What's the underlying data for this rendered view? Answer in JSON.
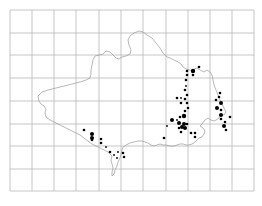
{
  "map": {
    "width": 262,
    "height": 206,
    "grid": {
      "color": "#b8b8b8",
      "x_lines": [
        10,
        32,
        54,
        76,
        99,
        121,
        143,
        166,
        188,
        210,
        232,
        254
      ],
      "y_lines": [
        10,
        33,
        55,
        78,
        101,
        124,
        146,
        169,
        191
      ],
      "left": 10,
      "right": 254,
      "top": 10,
      "bottom": 191
    },
    "outline": {
      "color": "#9a9a9a",
      "paths": [
        "M38,96 L42,92 L48,90 L56,88 L64,86 L72,84 L80,82 L86,80 L90,78 L91,74 L91,70 L92,65 L93,60 L95,56 L99,55 L103,54 L106,51 L110,52 L113,55 L116,58 L119,59 L122,57 L126,56 L130,54 L131,50 L129,45 L128,40 L130,36 L134,33 L139,31 L143,32 L147,35 L152,38 L156,43 L160,48 L163,53 L167,57 L170,58 L174,60 L178,62 L181,64 L183,67 L186,69 L190,70 L193,72 L194,69 L197,68 L200,70 L204,72 L207,70 L210,72 L212,75 L213,80 L214,85 L216,90 L218,95 L220,100 L222,104 L224,108 L226,112 L224,115 L221,115 L219,118 L216,120 L214,121 L211,120 L208,118 L205,120 L202,124 L200,126 L203,128 L205,131 L204,134 L202,137 L199,138 L197,140 L195,142 L192,144 L189,145 L186,145 L183,144 L180,144 L177,145 L174,146 L170,146 L166,145 L163,145 L160,144 L157,145 L154,146 L151,145 L148,143 L145,142 L142,141 L138,141 L134,142 L130,143 L126,145 L123,147",
        "M123,147 L122,150 L121,154 L120,158 L118,162 L117,166 L115,170 L114,174 L112,176 L112,172 L113,168 L112,164 L111,160 L112,156 L110,154 L108,152 L104,150 L100,148 L96,146 L92,144 L88,141 L84,138 L80,135 L74,132 L68,129 L62,126 L56,123 L50,120 L46,117 L45,113 L46,109 L44,106 L41,104 L39,101 L38,96"
      ]
    },
    "dots": [
      {
        "x": 199,
        "y": 67,
        "r": 1.3
      },
      {
        "x": 193,
        "y": 71,
        "r": 2.2
      },
      {
        "x": 187,
        "y": 71,
        "r": 1.3
      },
      {
        "x": 187,
        "y": 75,
        "r": 1.3
      },
      {
        "x": 193,
        "y": 75,
        "r": 1.3
      },
      {
        "x": 186,
        "y": 80,
        "r": 1.3
      },
      {
        "x": 186,
        "y": 86,
        "r": 0.9
      },
      {
        "x": 185,
        "y": 90,
        "r": 1.3
      },
      {
        "x": 187,
        "y": 95,
        "r": 1.3
      },
      {
        "x": 177,
        "y": 98,
        "r": 1.3
      },
      {
        "x": 181,
        "y": 98,
        "r": 0.9
      },
      {
        "x": 185,
        "y": 99,
        "r": 1.3
      },
      {
        "x": 181,
        "y": 103,
        "r": 1.3
      },
      {
        "x": 187,
        "y": 103,
        "r": 1.3
      },
      {
        "x": 188,
        "y": 108,
        "r": 1.3
      },
      {
        "x": 172,
        "y": 120,
        "r": 2.0
      },
      {
        "x": 177,
        "y": 120,
        "r": 0.9
      },
      {
        "x": 180,
        "y": 117,
        "r": 1.3
      },
      {
        "x": 184,
        "y": 116,
        "r": 2.2
      },
      {
        "x": 185,
        "y": 111,
        "r": 1.3
      },
      {
        "x": 179,
        "y": 123,
        "r": 2.0
      },
      {
        "x": 184,
        "y": 124,
        "r": 2.0
      },
      {
        "x": 182,
        "y": 127,
        "r": 2.0
      },
      {
        "x": 185,
        "y": 128,
        "r": 2.0
      },
      {
        "x": 187,
        "y": 124,
        "r": 1.3
      },
      {
        "x": 179,
        "y": 128,
        "r": 1.3
      },
      {
        "x": 181,
        "y": 132,
        "r": 1.3
      },
      {
        "x": 167,
        "y": 126,
        "r": 0.9
      },
      {
        "x": 164,
        "y": 138,
        "r": 1.3
      },
      {
        "x": 191,
        "y": 133,
        "r": 1.3
      },
      {
        "x": 195,
        "y": 133,
        "r": 1.3
      },
      {
        "x": 195,
        "y": 137,
        "r": 1.3
      },
      {
        "x": 220,
        "y": 93,
        "r": 1.3
      },
      {
        "x": 219,
        "y": 97,
        "r": 1.3
      },
      {
        "x": 216,
        "y": 100,
        "r": 1.3
      },
      {
        "x": 221,
        "y": 103,
        "r": 2.0
      },
      {
        "x": 217,
        "y": 108,
        "r": 2.0
      },
      {
        "x": 221,
        "y": 110,
        "r": 1.3
      },
      {
        "x": 221,
        "y": 115,
        "r": 2.0
      },
      {
        "x": 221,
        "y": 119,
        "r": 1.3
      },
      {
        "x": 225,
        "y": 122,
        "r": 1.3
      },
      {
        "x": 224,
        "y": 126,
        "r": 2.0
      },
      {
        "x": 226,
        "y": 130,
        "r": 1.3
      },
      {
        "x": 230,
        "y": 117,
        "r": 1.3
      },
      {
        "x": 84,
        "y": 130,
        "r": 1.3
      },
      {
        "x": 92,
        "y": 134,
        "r": 2.0
      },
      {
        "x": 92,
        "y": 138,
        "r": 2.0
      },
      {
        "x": 92,
        "y": 140,
        "r": 1.3
      },
      {
        "x": 101,
        "y": 139,
        "r": 1.3
      },
      {
        "x": 101,
        "y": 143,
        "r": 1.3
      },
      {
        "x": 106,
        "y": 147,
        "r": 0.9
      },
      {
        "x": 110,
        "y": 152,
        "r": 1.3
      },
      {
        "x": 114,
        "y": 155,
        "r": 0.9
      },
      {
        "x": 118,
        "y": 152,
        "r": 0.9
      },
      {
        "x": 123,
        "y": 153,
        "r": 1.3
      },
      {
        "x": 124,
        "y": 157,
        "r": 1.3
      },
      {
        "x": 117,
        "y": 158,
        "r": 0.9
      }
    ]
  }
}
